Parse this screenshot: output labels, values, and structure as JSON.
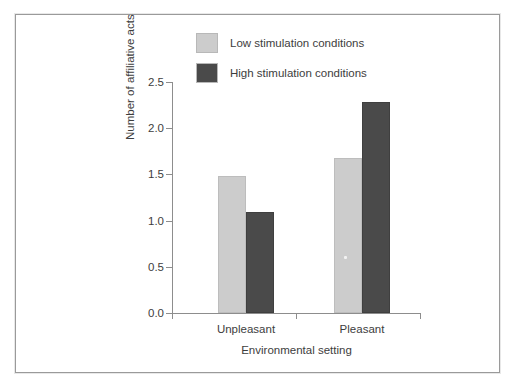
{
  "chart_data": {
    "type": "bar",
    "title": "",
    "xlabel": "Environmental setting",
    "ylabel": "Number of affiliative acts",
    "categories": [
      "Unpleasant",
      "Pleasant"
    ],
    "series": [
      {
        "name": "Low stimulation conditions",
        "color": "#cccccc",
        "values": [
          1.48,
          1.68
        ]
      },
      {
        "name": "High stimulation conditions",
        "color": "#4a4a4a",
        "values": [
          1.09,
          2.28
        ]
      }
    ],
    "ylim": [
      0.0,
      2.5
    ],
    "yticks": [
      "0.0",
      "0.5",
      "1.0",
      "1.5",
      "2.0",
      "2.5"
    ],
    "ytick_values": [
      0.0,
      0.5,
      1.0,
      1.5,
      2.0,
      2.5
    ],
    "grid": false,
    "legend_position": "top-center"
  },
  "legend": {
    "items": [
      {
        "label": "Low stimulation conditions",
        "color": "#cccccc"
      },
      {
        "label": "High stimulation conditions",
        "color": "#4a4a4a"
      }
    ]
  },
  "axes": {
    "y_title": "Number of affiliative acts",
    "x_title": "Environmental setting"
  }
}
